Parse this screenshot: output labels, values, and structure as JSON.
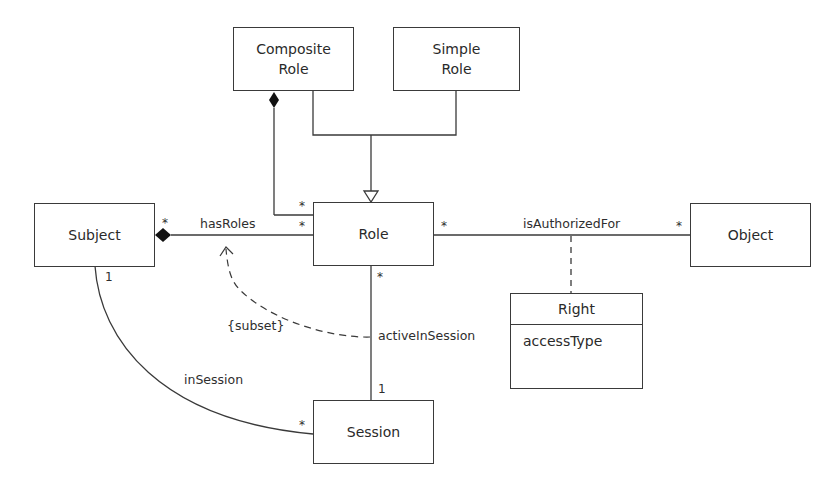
{
  "classes": {
    "composite_role": "Composite\nRole",
    "simple_role": "Simple\nRole",
    "subject": "Subject",
    "role": "Role",
    "object": "Object",
    "session": "Session",
    "right": {
      "name": "Right",
      "attributes": [
        "accessType"
      ]
    }
  },
  "associations": {
    "has_roles": {
      "label": "hasRoles",
      "subject_end": "*",
      "role_end": "*"
    },
    "composite_role_to_role": {
      "role_end": "*"
    },
    "is_authorized_for": {
      "label": "isAuthorizedFor",
      "role_end": "*",
      "object_end": "*"
    },
    "active_in_session": {
      "label": "activeInSession",
      "role_end": "*",
      "session_end": "1"
    },
    "in_session": {
      "label": "inSession",
      "subject_end": "1",
      "session_end": "*"
    },
    "subset_constraint": {
      "label": "{subset}"
    }
  },
  "colors": {
    "line": "#3a3a3a",
    "text": "#2a2a2a",
    "background": "#ffffff"
  }
}
